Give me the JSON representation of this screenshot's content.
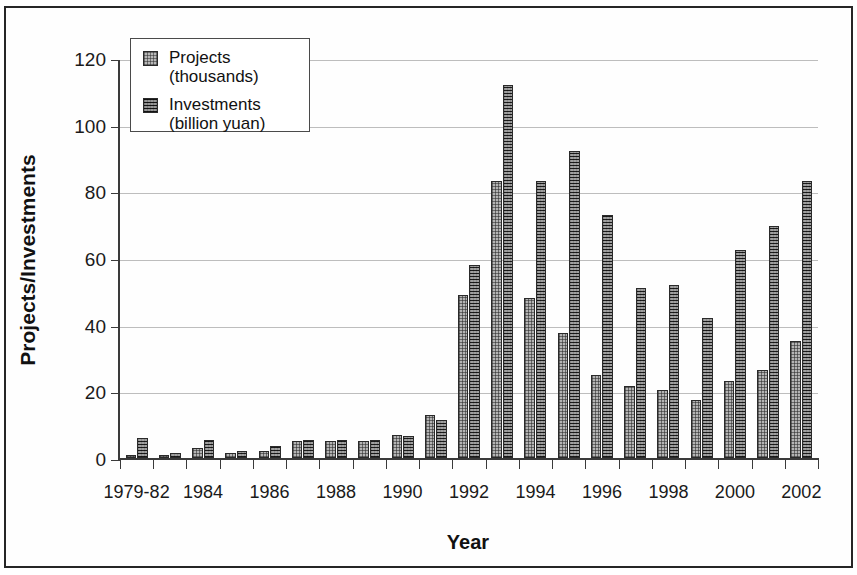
{
  "chart_data": {
    "type": "bar",
    "title": "",
    "xlabel": "Year",
    "ylabel": "Projects/Investments",
    "ylim": [
      0,
      120
    ],
    "yticks": [
      0,
      20,
      40,
      60,
      80,
      100,
      120
    ],
    "grid": true,
    "legend_position": "top-left",
    "categories": [
      "1979-82",
      "1983",
      "1984",
      "1985",
      "1986",
      "1987",
      "1988",
      "1989",
      "1990",
      "1991",
      "1992",
      "1993",
      "1994",
      "1995",
      "1996",
      "1997",
      "1998",
      "1999",
      "2000",
      "2001",
      "2002"
    ],
    "tick_labels": [
      "1979-82",
      "",
      "1984",
      "",
      "1986",
      "",
      "1988",
      "",
      "1990",
      "",
      "1992",
      "",
      "1994",
      "",
      "1996",
      "",
      "1998",
      "",
      "2000",
      "",
      "2002"
    ],
    "series": [
      {
        "name": "Projects",
        "unit": "(thousands)",
        "color": "#b4b4b4",
        "values": [
          1,
          1,
          3,
          1.5,
          2,
          5,
          5,
          5,
          7,
          13,
          49,
          83,
          48,
          37.5,
          25,
          21.5,
          20.5,
          17.5,
          23,
          26.5,
          35
        ]
      },
      {
        "name": "Investments",
        "unit": "(billion  yuan)",
        "color": "#4a4a4a",
        "values": [
          6,
          1.5,
          5.5,
          2,
          3.5,
          5.5,
          5.5,
          5.5,
          6.5,
          11.5,
          58,
          112,
          83,
          92,
          73,
          51,
          52,
          42,
          62.5,
          69.5,
          83
        ]
      }
    ]
  }
}
